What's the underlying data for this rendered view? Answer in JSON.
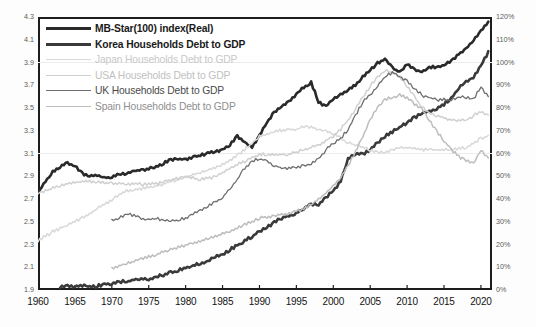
{
  "chart_data": {
    "type": "line",
    "title": "",
    "xlabel": "",
    "ylabel": "",
    "xlim": [
      1960,
      2021.5
    ],
    "ylim_left": [
      1.9,
      4.3
    ],
    "ylim_right": [
      0,
      120
    ],
    "y_left_ticks": [
      "4.3",
      "4.1",
      "3.9",
      "3.7",
      "3.5",
      "3.3",
      "3.1",
      "2.9",
      "2.7",
      "2.5",
      "2.3",
      "2.1",
      "1.9"
    ],
    "y_right_ticks": [
      "120%",
      "110%",
      "100%",
      "90%",
      "80%",
      "70%",
      "60%",
      "50%",
      "40%",
      "30%",
      "20%",
      "10%",
      "0%"
    ],
    "x_ticks": [
      "1960",
      "1965",
      "1970",
      "1975",
      "1980",
      "1985",
      "1990",
      "1995",
      "2000",
      "2005",
      "2010",
      "2015",
      "2020"
    ],
    "grid": "faint-horizontal",
    "legend_position": "top-left",
    "series": [
      {
        "name": "MB-Star(100) index(Real)",
        "axis": "left",
        "color": "#2a2a2a",
        "width": 2.6,
        "x": [
          1960,
          1961,
          1962,
          1963,
          1964,
          1965,
          1966,
          1967,
          1968,
          1969,
          1970,
          1971,
          1972,
          1973,
          1974,
          1975,
          1976,
          1977,
          1978,
          1979,
          1980,
          1981,
          1982,
          1983,
          1984,
          1985,
          1986,
          1987,
          1988,
          1989,
          1990,
          1991,
          1992,
          1993,
          1994,
          1995,
          1996,
          1997,
          1998,
          1999,
          2000,
          2001,
          2002,
          2003,
          2004,
          2005,
          2006,
          2007,
          2008,
          2009,
          2010,
          2011,
          2012,
          2013,
          2014,
          2015,
          2016,
          2017,
          2018,
          2019,
          2020,
          2021
        ],
        "y": [
          2.76,
          2.86,
          2.95,
          2.99,
          3.02,
          3.0,
          2.93,
          2.9,
          2.92,
          2.89,
          2.9,
          2.92,
          2.93,
          2.95,
          2.96,
          2.97,
          2.99,
          3.02,
          3.05,
          3.06,
          3.05,
          3.07,
          3.09,
          3.11,
          3.12,
          3.14,
          3.18,
          3.26,
          3.2,
          3.16,
          3.27,
          3.38,
          3.47,
          3.52,
          3.56,
          3.63,
          3.69,
          3.73,
          3.56,
          3.52,
          3.59,
          3.62,
          3.66,
          3.71,
          3.78,
          3.84,
          3.9,
          3.94,
          3.86,
          3.82,
          3.89,
          3.84,
          3.83,
          3.86,
          3.87,
          3.88,
          3.92,
          3.98,
          4.03,
          4.1,
          4.18,
          4.26
        ]
      },
      {
        "name": "Korea Households Debt to GDP",
        "axis": "right",
        "color": "#3a3a3a",
        "width": 2.6,
        "x": [
          1963,
          1964,
          1965,
          1966,
          1967,
          1968,
          1969,
          1970,
          1971,
          1972,
          1973,
          1974,
          1975,
          1976,
          1977,
          1978,
          1979,
          1980,
          1981,
          1982,
          1983,
          1984,
          1985,
          1986,
          1987,
          1988,
          1989,
          1990,
          1991,
          1992,
          1993,
          1994,
          1995,
          1996,
          1997,
          1998,
          1999,
          2000,
          2001,
          2002,
          2003,
          2004,
          2005,
          2006,
          2007,
          2008,
          2009,
          2010,
          2011,
          2012,
          2013,
          2014,
          2015,
          2016,
          2017,
          2018,
          2019,
          2020,
          2021
        ],
        "y": [
          2,
          2,
          2,
          2,
          2,
          2,
          3,
          3,
          4,
          4,
          5,
          5,
          5,
          6,
          7,
          8,
          9,
          10,
          11,
          12,
          13,
          15,
          16,
          18,
          20,
          22,
          24,
          26,
          28,
          30,
          32,
          33,
          34,
          36,
          38,
          38,
          41,
          44,
          48,
          58,
          60,
          60,
          62,
          65,
          68,
          70,
          72,
          74,
          76,
          78,
          79,
          80,
          82,
          85,
          89,
          92,
          94,
          99,
          105
        ]
      },
      {
        "name": "Japan Households Debt to GDP",
        "axis": "right",
        "color": "#d8d8d8",
        "width": 1.5,
        "x": [
          1960,
          1962,
          1964,
          1966,
          1968,
          1970,
          1972,
          1974,
          1976,
          1978,
          1980,
          1982,
          1984,
          1986,
          1988,
          1990,
          1992,
          1994,
          1995,
          1996,
          1997,
          1998,
          1999,
          2000,
          2001,
          2002,
          2003,
          2004,
          2005,
          2006,
          2007,
          2008,
          2009,
          2010,
          2012,
          2014,
          2016,
          2018,
          2020,
          2021
        ],
        "y": [
          22,
          26,
          29,
          32,
          36,
          40,
          44,
          45,
          46,
          48,
          50,
          52,
          54,
          57,
          62,
          68,
          70,
          71,
          71,
          72,
          72,
          71,
          70,
          69,
          67,
          65,
          64,
          63,
          62,
          61,
          61,
          62,
          63,
          63,
          62,
          62,
          62,
          63,
          67,
          68
        ]
      },
      {
        "name": "USA Households Debt to GDP",
        "axis": "right",
        "color": "#d0d0d0",
        "width": 1.5,
        "x": [
          1960,
          1962,
          1964,
          1966,
          1968,
          1970,
          1972,
          1974,
          1976,
          1978,
          1980,
          1982,
          1984,
          1986,
          1988,
          1990,
          1992,
          1994,
          1996,
          1998,
          2000,
          2001,
          2002,
          2003,
          2004,
          2005,
          2006,
          2007,
          2008,
          2009,
          2010,
          2011,
          2012,
          2013,
          2014,
          2016,
          2018,
          2020,
          2021
        ],
        "y": [
          43,
          45,
          47,
          48,
          48,
          47,
          47,
          47,
          47,
          49,
          50,
          49,
          50,
          54,
          57,
          60,
          60,
          60,
          62,
          64,
          68,
          71,
          75,
          80,
          85,
          90,
          94,
          97,
          96,
          94,
          90,
          85,
          81,
          78,
          77,
          75,
          75,
          79,
          77
        ]
      },
      {
        "name": "UK Households Debt to GDP",
        "axis": "right",
        "color": "#6e6e6e",
        "width": 1.3,
        "x": [
          1970,
          1971,
          1972,
          1973,
          1974,
          1975,
          1976,
          1977,
          1978,
          1979,
          1980,
          1981,
          1982,
          1983,
          1984,
          1985,
          1986,
          1987,
          1988,
          1989,
          1990,
          1991,
          1992,
          1993,
          1994,
          1995,
          1996,
          1997,
          1998,
          1999,
          2000,
          2001,
          2002,
          2003,
          2004,
          2005,
          2006,
          2007,
          2008,
          2009,
          2010,
          2011,
          2012,
          2013,
          2014,
          2015,
          2016,
          2017,
          2018,
          2019,
          2020,
          2021
        ],
        "y": [
          31,
          32,
          34,
          33,
          32,
          31,
          32,
          31,
          31,
          31,
          32,
          34,
          35,
          37,
          39,
          41,
          45,
          49,
          54,
          57,
          58,
          57,
          55,
          54,
          54,
          54,
          55,
          56,
          58,
          62,
          65,
          67,
          71,
          77,
          83,
          86,
          90,
          94,
          96,
          94,
          92,
          89,
          86,
          85,
          84,
          84,
          84,
          85,
          85,
          84,
          90,
          85
        ]
      },
      {
        "name": "Spain Households Debt to GDP",
        "axis": "right",
        "color": "#bdbdbd",
        "width": 1.5,
        "x": [
          1970,
          1972,
          1974,
          1976,
          1978,
          1980,
          1982,
          1984,
          1986,
          1988,
          1990,
          1992,
          1994,
          1996,
          1998,
          1999,
          2000,
          2001,
          2002,
          2003,
          2004,
          2005,
          2006,
          2007,
          2008,
          2009,
          2010,
          2011,
          2012,
          2013,
          2014,
          2015,
          2016,
          2017,
          2018,
          2019,
          2020,
          2021
        ],
        "y": [
          10,
          12,
          14,
          16,
          18,
          20,
          22,
          24,
          26,
          29,
          32,
          33,
          34,
          36,
          40,
          43,
          46,
          50,
          55,
          61,
          68,
          75,
          81,
          84,
          85,
          86,
          85,
          82,
          80,
          75,
          70,
          66,
          62,
          59,
          57,
          56,
          62,
          58
        ]
      }
    ]
  },
  "legend": {
    "items": [
      {
        "label": "MB-Star(100) index(Real)",
        "color": "#2a2a2a",
        "weight": 3.0,
        "text_color": "#1a1a1a",
        "bold": true
      },
      {
        "label": "Korea Households Debt to GDP",
        "color": "#3a3a3a",
        "weight": 3.0,
        "text_color": "#1a1a1a",
        "bold": true
      },
      {
        "label": "Japan Households Debt to GDP",
        "color": "#d8d8d8",
        "weight": 1.6,
        "text_color": "#c8c8c8",
        "bold": false
      },
      {
        "label": "USA Households Debt to GDP",
        "color": "#d0d0d0",
        "weight": 1.6,
        "text_color": "#c0c0c0",
        "bold": false
      },
      {
        "label": "UK Households Debt to GDP",
        "color": "#6e6e6e",
        "weight": 1.6,
        "text_color": "#4a4a4a",
        "bold": false
      },
      {
        "label": "Spain Households Debt to GDP",
        "color": "#bdbdbd",
        "weight": 1.6,
        "text_color": "#8f8f8f",
        "bold": false
      }
    ]
  }
}
